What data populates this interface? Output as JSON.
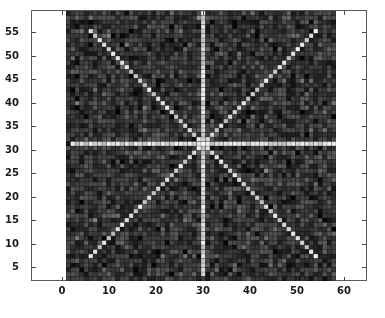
{
  "figure": {
    "background_color": "#ffffff",
    "axes_line_color": "#5a5a5a",
    "tick_label_color": "#1a1a1a"
  },
  "axes": {
    "x_ticks": [
      0,
      10,
      20,
      30,
      40,
      50,
      60
    ],
    "x_tick_labels": [
      "0",
      "10",
      "20",
      "30",
      "40",
      "50",
      "60"
    ],
    "y_ticks": [
      5,
      10,
      15,
      20,
      25,
      30,
      35,
      40,
      45,
      50,
      55
    ],
    "y_tick_labels": [
      "5",
      "10",
      "15",
      "20",
      "25",
      "30",
      "35",
      "40",
      "45",
      "50",
      "55"
    ],
    "xlabel": "",
    "ylabel": "",
    "title": "",
    "xlim": [
      -6,
      67
    ],
    "ylim": [
      0,
      60
    ],
    "grid": false
  },
  "chart_data": {
    "type": "heatmap",
    "title": "",
    "xlabel": "",
    "ylabel": "",
    "grid": false,
    "legend": "none",
    "categories": [],
    "x": [
      0,
      10,
      20,
      30,
      40,
      50,
      60
    ],
    "xlim": [
      -6,
      67
    ],
    "ylim": [
      0,
      60
    ],
    "rows": 60,
    "cols": 60,
    "data_extent": {
      "x_min": 1,
      "x_max": 59,
      "y_min": 1,
      "y_max": 59
    },
    "colormap": "gray",
    "value_range": [
      0,
      1
    ],
    "background_mean": 0.22,
    "background_noise_sigma": 0.09,
    "ray_value": 0.95,
    "center": {
      "x": 30,
      "y": 30
    },
    "pattern": "eight-ray star (radial spokes) over random noise",
    "rays": [
      {
        "name": "up",
        "angle_deg": 90,
        "dx": 0,
        "dy": 1,
        "length_cells": 29
      },
      {
        "name": "down",
        "angle_deg": 270,
        "dx": 0,
        "dy": -1,
        "length_cells": 29
      },
      {
        "name": "right",
        "angle_deg": 0,
        "dx": 1,
        "dy": 0,
        "length_cells": 29
      },
      {
        "name": "left",
        "angle_deg": 180,
        "dx": -1,
        "dy": 0,
        "length_cells": 29
      },
      {
        "name": "up-right",
        "angle_deg": 45,
        "dx": 1,
        "dy": 1,
        "length_cells": 25
      },
      {
        "name": "up-left",
        "angle_deg": 135,
        "dx": -1,
        "dy": 1,
        "length_cells": 25
      },
      {
        "name": "down-left",
        "angle_deg": 225,
        "dx": -1,
        "dy": -1,
        "length_cells": 25
      },
      {
        "name": "down-right",
        "angle_deg": 315,
        "dx": 1,
        "dy": -1,
        "length_cells": 25
      }
    ],
    "cell_grid_lines": true,
    "cell_size_px": 4.5
  }
}
